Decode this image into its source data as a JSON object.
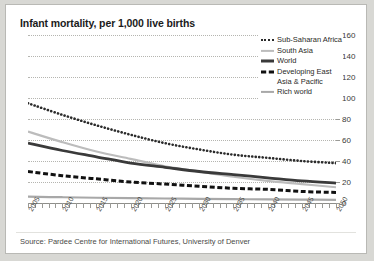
{
  "chart": {
    "title": "Infant mortality, per 1,000 live births",
    "source": "Source: Pardee Centre for International Futures, University of Denver"
  },
  "chart_data": {
    "type": "line",
    "title": "Infant mortality, per 1,000 live births",
    "xlabel": "",
    "ylabel": "",
    "xlim": [
      2005,
      2050
    ],
    "ylim": [
      0,
      160
    ],
    "yticks": [
      0,
      20,
      40,
      60,
      80,
      100,
      120,
      140,
      160
    ],
    "xticks": [
      2005,
      2010,
      2015,
      2020,
      2025,
      2030,
      2035,
      2040,
      2045,
      2050
    ],
    "xtick_labels": [
      "2005",
      "2010",
      "2015",
      "2020",
      "2025",
      "2030",
      "2035",
      "2040",
      "2045",
      "2050"
    ],
    "ytick_labels": [
      "0",
      "20",
      "40",
      "60",
      "80",
      "100",
      "120",
      "140",
      "160"
    ],
    "grid": true,
    "grid_style": "dotted-horizontal",
    "legend_position": "top-right",
    "x": [
      2005,
      2010,
      2015,
      2020,
      2025,
      2030,
      2035,
      2040,
      2045,
      2050
    ],
    "series": [
      {
        "name": "Sub-Saharan Africa",
        "style": "dotted",
        "color": "#2b2b2b",
        "values": [
          95,
          84,
          74,
          65,
          57,
          51,
          46,
          43,
          40,
          38
        ]
      },
      {
        "name": "South Asia",
        "style": "solid",
        "color": "#bcbcbc",
        "values": [
          68,
          58,
          49,
          42,
          35,
          30,
          25,
          21,
          18,
          15
        ]
      },
      {
        "name": "World",
        "style": "solid",
        "color": "#3a3a3a",
        "values": [
          57,
          50,
          44,
          38,
          34,
          30,
          27,
          24,
          21,
          19
        ]
      },
      {
        "name": "Developing East Asia & Pacific",
        "style": "dashed",
        "color": "#111111",
        "values": [
          30,
          26,
          23,
          20,
          18,
          16,
          14,
          13,
          11,
          10
        ]
      },
      {
        "name": "Rich world",
        "style": "solid",
        "color": "#a8a8a8",
        "values": [
          6,
          5.5,
          5,
          4.6,
          4.3,
          4,
          3.7,
          3.4,
          3.2,
          3
        ]
      }
    ]
  },
  "legend": {
    "entries": [
      {
        "label": "Sub-Saharan Africa",
        "swatch": "dotted-dark"
      },
      {
        "label": "South Asia",
        "swatch": "solid-light"
      },
      {
        "label": "World",
        "swatch": "solid-dark"
      },
      {
        "label": "Developing East",
        "swatch": "dashed-black"
      },
      {
        "label": "Asia & Pacific",
        "swatch": "none"
      },
      {
        "label": "Rich world",
        "swatch": "solid-mid"
      }
    ]
  }
}
